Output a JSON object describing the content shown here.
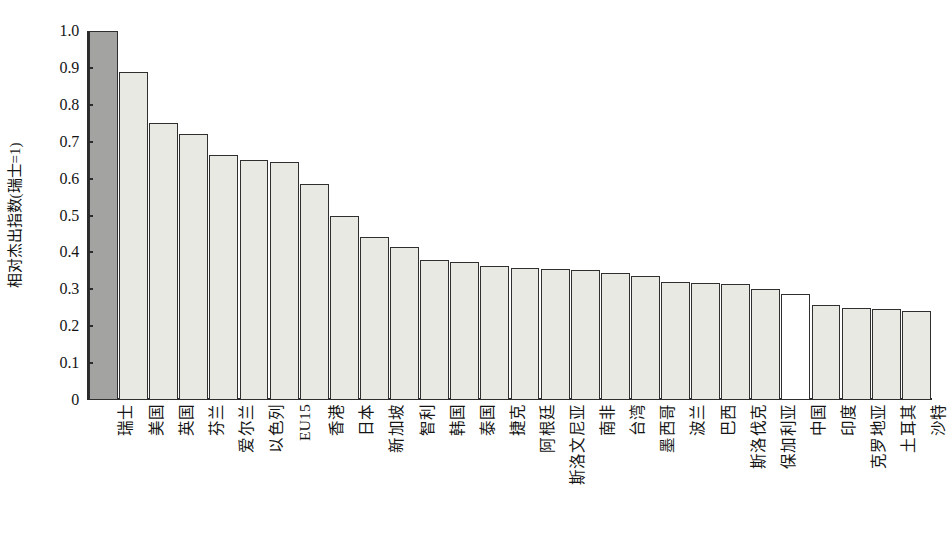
{
  "chart_data": {
    "type": "bar",
    "title": "",
    "xlabel": "",
    "ylabel": "相对杰出指数(瑞士=1)",
    "ylim": [
      0,
      1.0
    ],
    "grid": false,
    "legend": "none",
    "ytick_labels": [
      "1.0",
      "0.9",
      "0.8",
      "0.7",
      "0.6",
      "0.5",
      "0.4",
      "0.3",
      "0.2",
      "0.1",
      "0"
    ],
    "ytick_values": [
      1.0,
      0.9,
      0.8,
      0.7,
      0.6,
      0.5,
      0.4,
      0.3,
      0.2,
      0.1,
      0
    ],
    "categories": [
      "瑞士",
      "美国",
      "英国",
      "芬兰",
      "爱尔兰",
      "以色列",
      "EU15",
      "香港",
      "日本",
      "新加坡",
      "智利",
      "韩国",
      "泰国",
      "捷克",
      "阿根廷",
      "斯洛文尼亚",
      "南非",
      "台湾",
      "墨西哥",
      "波兰",
      "巴西",
      "斯洛伐克",
      "保加利亚",
      "中国",
      "印度",
      "克罗地亚",
      "土耳其",
      "沙特"
    ],
    "values": [
      1.0,
      0.89,
      0.75,
      0.72,
      0.665,
      0.65,
      0.645,
      0.585,
      0.5,
      0.443,
      0.415,
      0.38,
      0.375,
      0.363,
      0.357,
      0.355,
      0.353,
      0.345,
      0.337,
      0.32,
      0.317,
      0.315,
      0.3,
      0.287,
      0.258,
      0.25,
      0.246,
      0.24
    ],
    "bar_styles": [
      "highlight",
      "normal",
      "normal",
      "normal",
      "normal",
      "normal",
      "normal",
      "normal",
      "normal",
      "normal",
      "normal",
      "normal",
      "normal",
      "normal",
      "normal",
      "normal",
      "normal",
      "normal",
      "normal",
      "normal",
      "normal",
      "normal",
      "normal",
      "hollow",
      "normal",
      "normal",
      "normal",
      "normal"
    ],
    "colors": {
      "highlight_fill": "#a3a3a1",
      "normal_fill": "#e9e9e3",
      "hollow_fill": "#ffffff",
      "bar_stroke": "#2f2f2f",
      "axis": "#2b2b2b",
      "text": "#141414",
      "background": "#ffffff"
    }
  }
}
